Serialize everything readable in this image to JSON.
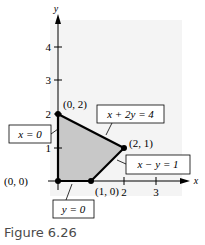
{
  "caption": "Figure 6.26",
  "axes": {
    "x_label": "x",
    "y_label": "y",
    "x_ticks": [
      "2",
      "3"
    ],
    "y_ticks": [
      "1",
      "2",
      "3",
      "4"
    ]
  },
  "vertices": [
    {
      "label": "(0, 0)",
      "x": 0,
      "y": 0
    },
    {
      "label": "(0, 2)",
      "x": 0,
      "y": 2
    },
    {
      "label": "(2, 1)",
      "x": 2,
      "y": 1
    },
    {
      "label": "(1, 0)",
      "x": 1,
      "y": 0
    }
  ],
  "constraints": [
    {
      "label": "x = 0"
    },
    {
      "label": "x + 2y = 4"
    },
    {
      "label": "x − y = 1"
    },
    {
      "label": "y = 0"
    }
  ],
  "colors": {
    "region_fill": "#c8c8c8",
    "panel_bg": "#f4f4f4",
    "boundary": "#000000"
  }
}
